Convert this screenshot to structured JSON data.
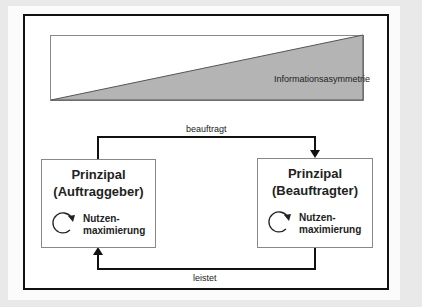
{
  "diagram": {
    "top_wedge": {
      "label": "Informationsasymmetrie",
      "fill": "#b4b4b4"
    },
    "arrows": {
      "top_label": "beauftragt",
      "bottom_label": "leistet"
    },
    "left_box": {
      "title": "Prinzipal",
      "subtitle": "(Auftraggeber)",
      "cycle_label_1": "Nutzen-",
      "cycle_label_2": "maximierung"
    },
    "right_box": {
      "title": "Prinzipal",
      "subtitle": "(Beauftragter)",
      "cycle_label_1": "Nutzen-",
      "cycle_label_2": "maximierung"
    }
  }
}
